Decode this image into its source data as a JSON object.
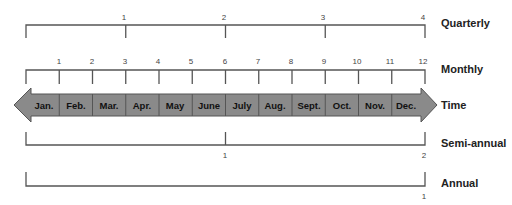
{
  "colors": {
    "line": "#555555",
    "arrow_fill": "#8a8a8a",
    "arrow_stroke": "#555555",
    "text": "#222222"
  },
  "rows": {
    "quarterly": {
      "label": "Quarterly",
      "ticks": [
        "1",
        "2",
        "3",
        "4"
      ]
    },
    "monthly": {
      "label": "Monthly",
      "ticks": [
        "1",
        "2",
        "3",
        "4",
        "5",
        "6",
        "7",
        "8",
        "9",
        "10",
        "11",
        "12"
      ]
    },
    "time": {
      "label": "Time",
      "months": [
        "Jan.",
        "Feb.",
        "Mar.",
        "Apr.",
        "May",
        "June",
        "July",
        "Aug.",
        "Sept.",
        "Oct.",
        "Nov.",
        "Dec."
      ]
    },
    "semi_annual": {
      "label": "Semi-annual",
      "ticks": [
        "1",
        "2"
      ]
    },
    "annual": {
      "label": "Annual",
      "ticks": [
        "1"
      ]
    }
  }
}
